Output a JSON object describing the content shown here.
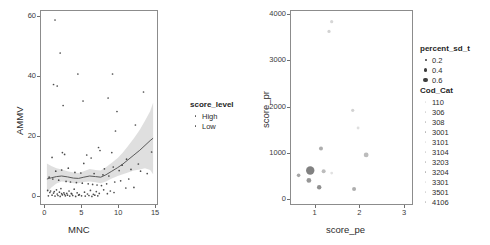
{
  "figure": {
    "width": 490,
    "height": 245,
    "background": "#ffffff",
    "panel_count": 2
  },
  "chart_data": [
    {
      "id": "left-panel",
      "type": "scatter",
      "title": "",
      "xlabel": "MNC",
      "ylabel": "AMMV",
      "xlim": [
        -0.6,
        15.4
      ],
      "ylim": [
        -3,
        62
      ],
      "xticks": [
        0,
        5,
        10,
        15
      ],
      "yticks": [
        0,
        20,
        40,
        60
      ],
      "xtick_labels": [
        "0",
        "5",
        "10",
        "15"
      ],
      "ytick_labels": [
        "0",
        "20",
        "40",
        "60"
      ],
      "grid": false,
      "legend": {
        "title": "score_level",
        "position": "right",
        "entries": [
          {
            "label": "High",
            "marker": "point",
            "color": "#555555",
            "size": 1.6
          },
          {
            "label": "Low",
            "marker": "point",
            "color": "#555555",
            "size": 1.6
          }
        ]
      },
      "smooth": {
        "name": "loess",
        "line_color": "#5a5a5a",
        "band_color": "#cccccc",
        "band_opacity": 0.62,
        "x": [
          0.2,
          0.8,
          1.5,
          2.2,
          3.0,
          3.8,
          4.5,
          5.2,
          6.0,
          6.8,
          7.5,
          8.2,
          9.0,
          9.8,
          10.5,
          11.2,
          12.0,
          12.8,
          13.5,
          14.2,
          14.6
        ],
        "y": [
          6.0,
          6.4,
          6.8,
          7.0,
          6.7,
          6.3,
          6.2,
          6.6,
          7.0,
          6.8,
          6.6,
          7.4,
          8.6,
          9.8,
          11.0,
          12.4,
          14.0,
          15.6,
          17.2,
          18.8,
          19.6
        ],
        "ymin": [
          1.4,
          3.2,
          4.5,
          5.2,
          5.0,
          4.6,
          4.6,
          5.0,
          5.2,
          4.9,
          4.6,
          5.2,
          6.2,
          7.0,
          7.6,
          8.2,
          8.8,
          9.2,
          9.6,
          9.0,
          7.6
        ],
        "ymax": [
          11.2,
          10.3,
          9.6,
          9.2,
          8.6,
          8.2,
          8.0,
          8.6,
          9.3,
          9.0,
          8.8,
          9.9,
          11.4,
          13.0,
          14.8,
          17.0,
          19.6,
          22.4,
          25.4,
          28.6,
          31.4
        ]
      },
      "points": [
        {
          "x": 1.3,
          "y": 59.0
        },
        {
          "x": 2.0,
          "y": 48.0
        },
        {
          "x": 1.1,
          "y": 37.5
        },
        {
          "x": 1.6,
          "y": 37.0
        },
        {
          "x": 2.4,
          "y": 30.5
        },
        {
          "x": 4.4,
          "y": 41.0
        },
        {
          "x": 5.1,
          "y": 32.0
        },
        {
          "x": 9.1,
          "y": 41.0
        },
        {
          "x": 8.5,
          "y": 33.0
        },
        {
          "x": 9.7,
          "y": 28.5
        },
        {
          "x": 13.3,
          "y": 35.0
        },
        {
          "x": 12.2,
          "y": 24.0
        },
        {
          "x": 9.5,
          "y": 22.0
        },
        {
          "x": 7.2,
          "y": 16.5
        },
        {
          "x": 7.4,
          "y": 15.5
        },
        {
          "x": 9.0,
          "y": 14.8
        },
        {
          "x": 14.4,
          "y": 15.0
        },
        {
          "x": 2.3,
          "y": 14.8
        },
        {
          "x": 2.6,
          "y": 14.2
        },
        {
          "x": 5.6,
          "y": 14.0
        },
        {
          "x": 0.9,
          "y": 13.2
        },
        {
          "x": 6.2,
          "y": 13.0
        },
        {
          "x": 5.2,
          "y": 11.2
        },
        {
          "x": 11.0,
          "y": 12.6
        },
        {
          "x": 12.6,
          "y": 11.0
        },
        {
          "x": 10.4,
          "y": 10.6
        },
        {
          "x": 9.2,
          "y": 10.0
        },
        {
          "x": 8.0,
          "y": 9.4
        },
        {
          "x": 3.1,
          "y": 9.6
        },
        {
          "x": 2.2,
          "y": 9.0
        },
        {
          "x": 1.4,
          "y": 8.6
        },
        {
          "x": 4.0,
          "y": 8.2
        },
        {
          "x": 4.8,
          "y": 8.0
        },
        {
          "x": 6.6,
          "y": 7.8
        },
        {
          "x": 7.8,
          "y": 7.4
        },
        {
          "x": 8.6,
          "y": 7.0
        },
        {
          "x": 10.0,
          "y": 8.8
        },
        {
          "x": 11.6,
          "y": 9.2
        },
        {
          "x": 12.9,
          "y": 8.6
        },
        {
          "x": 13.8,
          "y": 7.8
        },
        {
          "x": 0.5,
          "y": 6.6
        },
        {
          "x": 1.0,
          "y": 6.0
        },
        {
          "x": 1.8,
          "y": 5.6
        },
        {
          "x": 2.8,
          "y": 5.2
        },
        {
          "x": 3.4,
          "y": 5.0
        },
        {
          "x": 4.2,
          "y": 4.8
        },
        {
          "x": 5.0,
          "y": 4.6
        },
        {
          "x": 5.8,
          "y": 4.4
        },
        {
          "x": 6.4,
          "y": 4.2
        },
        {
          "x": 7.0,
          "y": 4.0
        },
        {
          "x": 7.6,
          "y": 3.8
        },
        {
          "x": 8.3,
          "y": 4.4
        },
        {
          "x": 9.4,
          "y": 5.0
        },
        {
          "x": 10.2,
          "y": 5.4
        },
        {
          "x": 11.3,
          "y": 6.0
        },
        {
          "x": 12.0,
          "y": 3.2
        },
        {
          "x": 10.9,
          "y": 3.0
        },
        {
          "x": 0.3,
          "y": 2.2
        },
        {
          "x": 0.7,
          "y": 2.0
        },
        {
          "x": 1.2,
          "y": 1.8
        },
        {
          "x": 1.5,
          "y": 2.4
        },
        {
          "x": 1.9,
          "y": 1.6
        },
        {
          "x": 2.1,
          "y": 2.8
        },
        {
          "x": 2.5,
          "y": 1.4
        },
        {
          "x": 2.9,
          "y": 1.2
        },
        {
          "x": 3.2,
          "y": 2.0
        },
        {
          "x": 3.6,
          "y": 1.0
        },
        {
          "x": 3.9,
          "y": 2.6
        },
        {
          "x": 4.3,
          "y": 1.4
        },
        {
          "x": 4.6,
          "y": 0.8
        },
        {
          "x": 5.3,
          "y": 1.6
        },
        {
          "x": 5.7,
          "y": 1.0
        },
        {
          "x": 6.1,
          "y": 2.2
        },
        {
          "x": 6.5,
          "y": 0.9
        },
        {
          "x": 6.9,
          "y": 1.8
        },
        {
          "x": 7.3,
          "y": 1.2
        },
        {
          "x": 7.9,
          "y": 2.4
        },
        {
          "x": 8.4,
          "y": 1.1
        },
        {
          "x": 8.8,
          "y": 2.0
        },
        {
          "x": 9.3,
          "y": 1.5
        },
        {
          "x": 0.4,
          "y": 0.4
        },
        {
          "x": 0.9,
          "y": 0.6
        },
        {
          "x": 1.3,
          "y": 0.3
        },
        {
          "x": 1.7,
          "y": 0.5
        },
        {
          "x": 2.0,
          "y": 0.2
        },
        {
          "x": 2.3,
          "y": 0.7
        },
        {
          "x": 2.7,
          "y": 0.4
        },
        {
          "x": 3.0,
          "y": 0.6
        },
        {
          "x": 3.3,
          "y": 0.3
        },
        {
          "x": 3.7,
          "y": 0.5
        },
        {
          "x": 4.1,
          "y": 0.2
        },
        {
          "x": 4.5,
          "y": 0.6
        },
        {
          "x": 4.9,
          "y": 0.4
        },
        {
          "x": 5.4,
          "y": 0.3
        },
        {
          "x": 5.9,
          "y": 0.5
        },
        {
          "x": 6.3,
          "y": 0.2
        },
        {
          "x": 6.7,
          "y": 0.6
        },
        {
          "x": 7.1,
          "y": 0.4
        },
        {
          "x": 1.6,
          "y": 1.0
        },
        {
          "x": 2.2,
          "y": 1.1
        },
        {
          "x": 1.1,
          "y": 1.3
        },
        {
          "x": 2.6,
          "y": 0.9
        },
        {
          "x": 3.5,
          "y": 1.2
        },
        {
          "x": 0.6,
          "y": 1.5
        }
      ]
    },
    {
      "id": "right-panel",
      "type": "scatter",
      "title": "",
      "xlabel": "score_pe",
      "ylabel": "score_pr",
      "xlim": [
        0.45,
        3.2
      ],
      "ylim": [
        -120,
        4080
      ],
      "xticks": [
        1,
        2,
        3
      ],
      "yticks": [
        0,
        1000,
        2000,
        3000,
        4000
      ],
      "xtick_labels": [
        "1",
        "2",
        "3"
      ],
      "ytick_labels": [
        "0",
        "1000",
        "2000",
        "3000",
        "4000"
      ],
      "grid": false,
      "legends": [
        {
          "title": "percent_sd_t",
          "type": "size",
          "entries": [
            {
              "label": "0.2",
              "size": 2.0
            },
            {
              "label": "0.4",
              "size": 3.2
            },
            {
              "label": "0.6",
              "size": 4.4
            }
          ]
        },
        {
          "title": "Cod_Cat",
          "type": "color",
          "entries": [
            {
              "label": "110"
            },
            {
              "label": "306"
            },
            {
              "label": "308"
            },
            {
              "label": "3001"
            },
            {
              "label": "3101"
            },
            {
              "label": "3104"
            },
            {
              "label": "3203"
            },
            {
              "label": "3204"
            },
            {
              "label": "3301"
            },
            {
              "label": "3501"
            },
            {
              "label": "4106"
            }
          ]
        }
      ],
      "points": [
        {
          "x": 1.36,
          "y": 3850,
          "size": 1.6,
          "opacity": 0.28
        },
        {
          "x": 1.3,
          "y": 3640,
          "size": 1.6,
          "opacity": 0.3
        },
        {
          "x": 1.83,
          "y": 1940,
          "size": 1.6,
          "opacity": 0.3
        },
        {
          "x": 1.95,
          "y": 1560,
          "size": 1.4,
          "opacity": 0.22
        },
        {
          "x": 1.12,
          "y": 1120,
          "size": 2.0,
          "opacity": 0.55
        },
        {
          "x": 2.13,
          "y": 980,
          "size": 2.4,
          "opacity": 0.45
        },
        {
          "x": 0.88,
          "y": 645,
          "size": 4.2,
          "opacity": 0.85
        },
        {
          "x": 1.18,
          "y": 630,
          "size": 2.0,
          "opacity": 0.45
        },
        {
          "x": 1.36,
          "y": 590,
          "size": 1.4,
          "opacity": 0.2
        },
        {
          "x": 0.62,
          "y": 540,
          "size": 1.8,
          "opacity": 0.6
        },
        {
          "x": 0.85,
          "y": 430,
          "size": 2.4,
          "opacity": 0.7
        },
        {
          "x": 1.08,
          "y": 285,
          "size": 2.2,
          "opacity": 0.75
        },
        {
          "x": 1.86,
          "y": 245,
          "size": 2.0,
          "opacity": 0.55
        }
      ]
    }
  ]
}
